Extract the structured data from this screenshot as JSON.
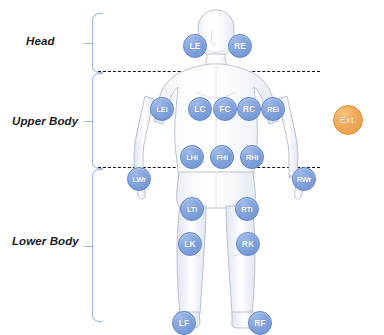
{
  "diagram": {
    "title_regions": [
      {
        "id": "head",
        "label": "Head"
      },
      {
        "id": "upper",
        "label": "Upper Body"
      },
      {
        "id": "lower",
        "label": "Lower Body"
      }
    ],
    "external_node": {
      "label": "Ext.",
      "color": "#efa654"
    },
    "node_color": "#7d9fda",
    "divider_color": "#111111",
    "bracket_color": "#9cb7e0",
    "nodes": [
      {
        "label": "LE",
        "region": "head",
        "x": 183,
        "y": 34
      },
      {
        "label": "RE",
        "region": "head",
        "x": 228,
        "y": 34
      },
      {
        "label": "LEl",
        "region": "upper",
        "x": 150,
        "y": 97
      },
      {
        "label": "LC",
        "region": "upper",
        "x": 188,
        "y": 97
      },
      {
        "label": "FC",
        "region": "upper",
        "x": 213,
        "y": 97
      },
      {
        "label": "RC",
        "region": "upper",
        "x": 237,
        "y": 97
      },
      {
        "label": "REl",
        "region": "upper",
        "x": 261,
        "y": 97
      },
      {
        "label": "LHi",
        "region": "upper",
        "x": 180,
        "y": 145
      },
      {
        "label": "FHi",
        "region": "upper",
        "x": 210,
        "y": 145
      },
      {
        "label": "RHi",
        "region": "upper",
        "x": 240,
        "y": 145
      },
      {
        "label": "LWr",
        "region": "lower",
        "x": 127,
        "y": 167
      },
      {
        "label": "RWr",
        "region": "lower",
        "x": 292,
        "y": 167
      },
      {
        "label": "LTi",
        "region": "lower",
        "x": 180,
        "y": 197
      },
      {
        "label": "RTi",
        "region": "lower",
        "x": 235,
        "y": 197
      },
      {
        "label": "LK",
        "region": "lower",
        "x": 178,
        "y": 232
      },
      {
        "label": "RK",
        "region": "lower",
        "x": 236,
        "y": 232
      },
      {
        "label": "LF",
        "region": "lower",
        "x": 172,
        "y": 311
      },
      {
        "label": "RF",
        "region": "lower",
        "x": 248,
        "y": 311
      }
    ]
  }
}
